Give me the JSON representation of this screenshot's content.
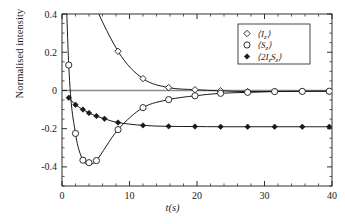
{
  "chart_data": {
    "type": "line",
    "title": "",
    "xlabel": "t(s)",
    "ylabel": "Normalised intensity",
    "xlim": [
      0,
      40
    ],
    "ylim": [
      -0.5,
      0.4
    ],
    "xticks": [
      0,
      10,
      20,
      30,
      40
    ],
    "xticklabels": [
      "0",
      "10",
      "20",
      "30",
      "40"
    ],
    "yticks": [
      -0.4,
      -0.2,
      0,
      0.2,
      0.4
    ],
    "yticklabels": [
      "-0.4",
      "-0.2",
      "0",
      "0.2",
      "0.4"
    ],
    "x_minor_step": 2,
    "y_minor_step": 0.05,
    "grid": false,
    "zero_line": true,
    "zero_line_color": "#8c8c8c",
    "legend_position": "upper-right",
    "series": [
      {
        "name": "<I_z>",
        "marker": "open-diamond",
        "color": "#1a1a1a",
        "x": [
          1.0,
          2.0,
          4.0,
          8.3,
          12.0,
          15.8,
          19.7,
          23.5,
          27.5,
          31.5,
          35.6,
          39.6
        ],
        "values": [
          1.0,
          0.78,
          0.52,
          0.205,
          0.062,
          0.015,
          0.004,
          -0.002,
          -0.006,
          -0.005,
          -0.004,
          -0.004
        ]
      },
      {
        "name": "<S_z>",
        "marker": "open-circle",
        "color": "#1a1a1a",
        "x": [
          1.0,
          2.0,
          3.1,
          4.0,
          5.1,
          8.3,
          12.0,
          15.8,
          19.7,
          23.5,
          27.5,
          31.5,
          35.6,
          39.6
        ],
        "values": [
          0.133,
          -0.225,
          -0.365,
          -0.378,
          -0.367,
          -0.205,
          -0.09,
          -0.048,
          -0.028,
          -0.015,
          -0.01,
          -0.006,
          -0.005,
          -0.004
        ]
      },
      {
        "name": "<2I_zS_z>",
        "marker": "filled-diamond",
        "color": "#1a1a1a",
        "x": [
          1.0,
          2.0,
          3.1,
          4.0,
          5.1,
          6.3,
          8.3,
          12.0,
          15.8,
          19.7,
          23.5,
          27.5,
          31.5,
          35.6,
          39.6
        ],
        "values": [
          -0.038,
          -0.075,
          -0.1,
          -0.118,
          -0.134,
          -0.148,
          -0.168,
          -0.183,
          -0.188,
          -0.189,
          -0.19,
          -0.19,
          -0.19,
          -0.19,
          -0.19
        ]
      }
    ],
    "legend_entries": [
      {
        "label": "<I_z>",
        "marker": "open-diamond"
      },
      {
        "label": "<S_z>",
        "marker": "open-circle"
      },
      {
        "label": "<2I_zS_z>",
        "marker": "filled-diamond"
      }
    ]
  },
  "axes": {
    "ylabel": "Normalised intensity",
    "xlabel_italic": "t(s)"
  },
  "legend": {
    "entry0": "<I",
    "entry0_sub": "z",
    "entry0_end": ">",
    "entry1": "<S",
    "entry1_sub": "z",
    "entry1_end": ">",
    "entry2": "<2I",
    "entry2_sub": "z",
    "entry2_mid": "S",
    "entry2_sub2": "z",
    "entry2_end": ">"
  },
  "xticklabels": {
    "t0": "0",
    "t1": "10",
    "t2": "20",
    "t3": "30",
    "t4": "40"
  },
  "yticklabels": {
    "t0": "0.4",
    "t1": "0.2",
    "t2": "0",
    "t3": "-0.2",
    "t4": "-0.4"
  }
}
